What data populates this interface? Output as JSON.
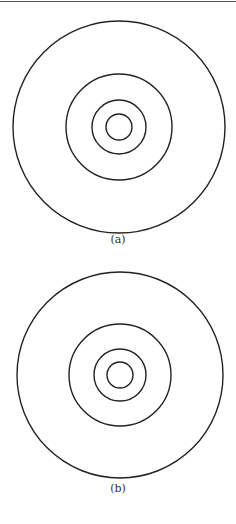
{
  "figures": [
    {
      "caption": "(a)",
      "center": [
        119,
        127
      ],
      "radii": [
        106,
        53,
        27,
        13
      ],
      "caption_y": 233
    },
    {
      "caption": "(b)",
      "center": [
        120,
        375
      ],
      "radii": [
        103,
        51,
        26,
        13
      ],
      "caption_y": 482
    }
  ],
  "stroke_color": "#222222"
}
